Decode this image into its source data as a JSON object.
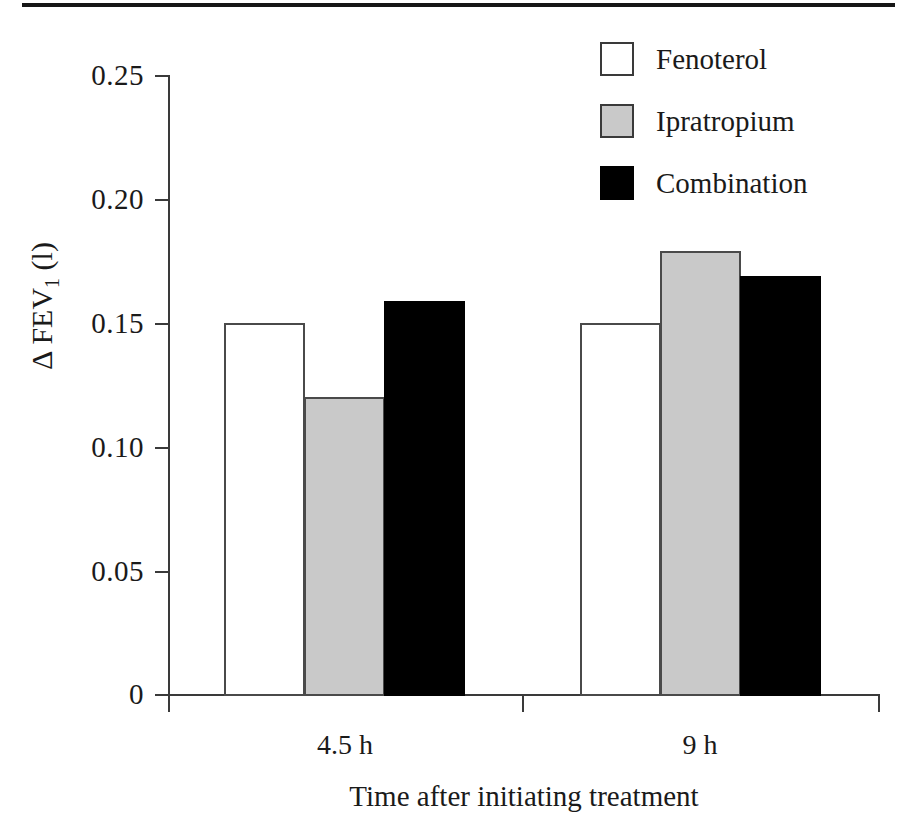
{
  "chart_data": {
    "type": "bar",
    "title": "",
    "subtitle": "",
    "xlabel": "Time after initiating treatment",
    "ylabel": "Δ FEV1 (l)",
    "ylabel_parts": {
      "delta": "Δ",
      "base": "FEV",
      "subscript": "1",
      "unit": "(l)"
    },
    "categories": [
      "4.5 h",
      "9 h"
    ],
    "category_tick_labels": [
      "4.5 h",
      "9 h"
    ],
    "series": [
      {
        "name": "Fenoterol",
        "values": [
          0.15,
          0.15
        ],
        "color": "#ffffff"
      },
      {
        "name": "Ipratropium",
        "values": [
          0.12,
          0.179
        ],
        "color": "#c9c9c9"
      },
      {
        "name": "Combination",
        "values": [
          0.159,
          0.169
        ],
        "color": "#000000"
      }
    ],
    "ylim": [
      0,
      0.25
    ],
    "ytick_values": [
      0,
      0.05,
      0.1,
      0.15,
      0.2,
      0.25
    ],
    "ytick_labels": [
      "0",
      "0.05",
      "0.10",
      "0.15",
      "0.20",
      "0.25"
    ],
    "grid": false,
    "legend_position": "top-right",
    "axis_color": "#3a3a3a",
    "bar_edge_color": "#4a4a4a"
  },
  "legend": {
    "entries": [
      {
        "label": "Fenoterol",
        "swatch": "white"
      },
      {
        "label": "Ipratropium",
        "swatch": "gray"
      },
      {
        "label": "Combination",
        "swatch": "black"
      }
    ]
  }
}
